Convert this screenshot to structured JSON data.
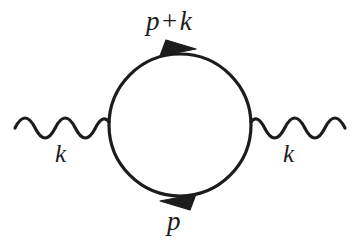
{
  "figure": {
    "background_color": "#ffffff",
    "ink_color": "#1c1c1c"
  },
  "labels": {
    "top_momentum": {
      "left_term": "p",
      "operator": "+",
      "right_term": "k",
      "full": "p + k"
    },
    "bottom_momentum": "p",
    "left_external_momentum": "k",
    "right_external_momentum": "k"
  },
  "geometry": {
    "loop": {
      "center_x": 180,
      "center_y": 125,
      "radius": 71,
      "stroke_width": 3.2
    },
    "left_photon": {
      "start_x": 15,
      "end_x": 109,
      "center_y": 128,
      "amplitude": 7,
      "periods": 3.5,
      "stroke_width": 3.2
    },
    "right_photon": {
      "start_x": 251,
      "end_x": 345,
      "center_y": 128,
      "amplitude": 7,
      "periods": 3.5,
      "stroke_width": 3.2
    },
    "top_arrow": {
      "x": 178,
      "y": 51,
      "direction": "right-clockwise"
    },
    "bottom_arrow": {
      "x": 178,
      "y": 199,
      "direction": "left-clockwise"
    }
  }
}
